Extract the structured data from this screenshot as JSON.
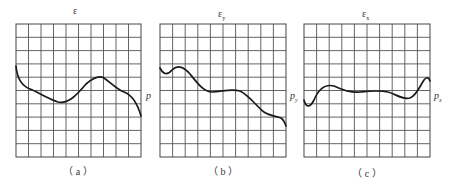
{
  "panels": [
    {
      "id": "a",
      "title": "ε",
      "title_sub": "",
      "side_label": "p",
      "side_sub": "",
      "caption": "（ a ）",
      "grid": {
        "x": 16,
        "y": 24,
        "w": 125,
        "h": 133,
        "cols": 10,
        "rows": 10
      },
      "curve_path": "M16,66 C17,78 22,86 30,89 C38,92 46,98 58,102 C68,104 76,96 86,84 C93,78 99,75 104,78 C110,82 116,89 124,92 C132,95 137,102 141,116"
    },
    {
      "id": "b",
      "title": "ε",
      "title_sub": "y",
      "side_label": "p",
      "side_sub": "y",
      "caption": "（ b ）",
      "grid": {
        "x": 160,
        "y": 24,
        "w": 126,
        "h": 133,
        "cols": 10,
        "rows": 10
      },
      "curve_path": "M160,68 C163,74 167,76 172,70 C177,65 183,66 190,74 C198,84 204,92 212,92 C222,92 230,88 240,91 C250,96 256,106 264,112 C270,116 276,116 281,118 C284,120 285,123 286,126"
    },
    {
      "id": "c",
      "title": "ε",
      "title_sub": "x",
      "side_label": "p",
      "side_sub": "x",
      "caption": "（ c ）",
      "grid": {
        "x": 304,
        "y": 24,
        "w": 126,
        "h": 133,
        "cols": 10,
        "rows": 10
      },
      "curve_path": "M304,100 C306,108 310,108 314,100 C319,88 326,84 334,86 C344,90 350,93 360,92 C370,91 378,90 388,92 C396,94 402,100 410,98 C416,96 420,86 424,80 C427,76 429,78 430,81"
    }
  ]
}
